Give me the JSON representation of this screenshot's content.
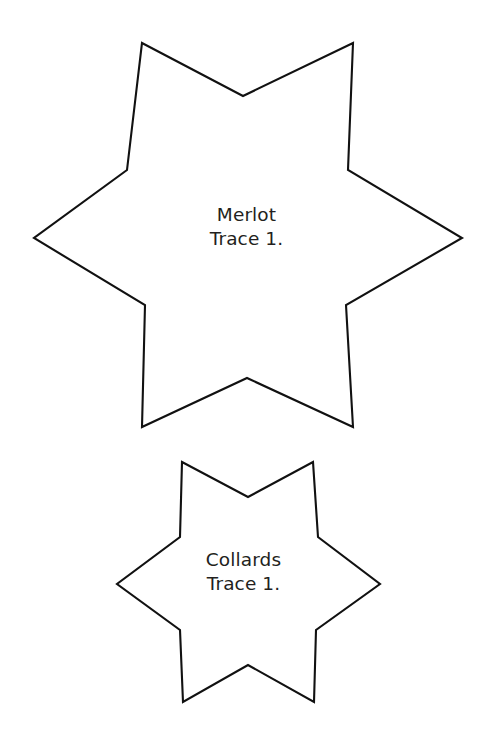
{
  "page": {
    "background_color": "#ffffff",
    "width": 485,
    "height": 731
  },
  "shapes": [
    {
      "id": "merlot-star",
      "name": "six-pointed-star-large",
      "kind": "star",
      "points": 6,
      "stroke_color": "#111111",
      "fill_color": "#ffffff",
      "stroke_width": 2.1,
      "center": {
        "x": 247,
        "y": 236
      },
      "outer_radius": 196,
      "inner_radius": 112,
      "polygon": "142,43 243,96 353,43 348,170 462,238 346,305 353,427 247,378 142,427 145,305 34,238 127,170",
      "label": {
        "line1": "Merlot",
        "line2": "Trace 1."
      }
    },
    {
      "id": "collards-star",
      "name": "six-pointed-star-small",
      "kind": "star",
      "points": 6,
      "stroke_color": "#111111",
      "fill_color": "#ffffff",
      "stroke_width": 2.1,
      "center": {
        "x": 248,
        "y": 584
      },
      "outer_radius": 132,
      "inner_radius": 76,
      "polygon": "182,462 248,497 313,462 318,537 380,584 316,630 314,702 248,665 183,702 180,630 117,584 180,537",
      "label": {
        "line1": "Collards",
        "line2": "Trace 1."
      }
    }
  ]
}
